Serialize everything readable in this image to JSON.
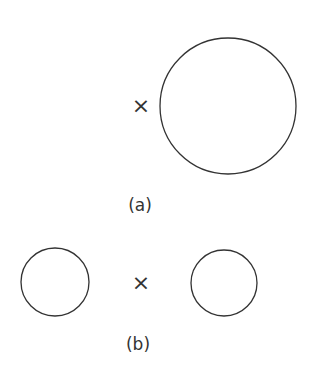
{
  "figure_a": {
    "label": "(a)",
    "marker": "×",
    "circle": {
      "cx": 228,
      "cy": 106,
      "r": 68
    },
    "marker_pos": {
      "x": 141,
      "y": 106
    }
  },
  "figure_b": {
    "label": "(b)",
    "marker": "×",
    "circles": [
      {
        "cx": 55,
        "cy": 282,
        "r": 34
      },
      {
        "cx": 224,
        "cy": 283,
        "r": 33
      }
    ],
    "marker_pos": {
      "x": 141,
      "y": 283
    }
  },
  "colors": {
    "stroke": "#333333",
    "background": "#ffffff"
  }
}
